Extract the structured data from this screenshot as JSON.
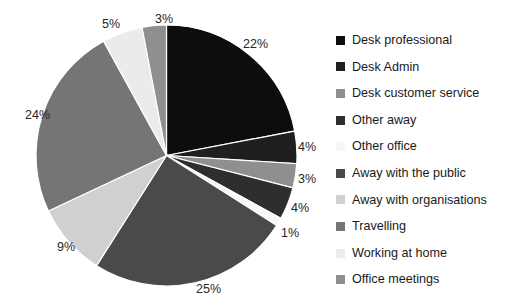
{
  "chart_data": {
    "type": "pie",
    "title": "",
    "subtitle": "",
    "xlabel": "",
    "ylabel": "",
    "legend_position": "right",
    "grid": false,
    "start_angle_deg": 0,
    "direction": "clockwise",
    "units": "%",
    "categories": [
      "Desk professional",
      "Desk Admin",
      "Desk customer service",
      "Other away",
      "Other office",
      "Away with the public",
      "Away with organisations",
      "Travelling",
      "Working at home",
      "Office meetings"
    ],
    "values": [
      22,
      4,
      3,
      4,
      1,
      25,
      9,
      24,
      5,
      3
    ],
    "data_labels": [
      "22%",
      "4%",
      "3%",
      "4%",
      "1%",
      "25%",
      "9%",
      "24%",
      "5%",
      "3%"
    ],
    "colors": [
      "#0d0d0d",
      "#1f1f1f",
      "#8f8f8f",
      "#2e2e2e",
      "#f7f7f7",
      "#4a4a4a",
      "#d0d0d0",
      "#757575",
      "#ebebeb",
      "#8f8f8f"
    ],
    "slices": [
      {
        "label": "Desk professional",
        "value": 22,
        "display": "22%",
        "color": "#0d0d0d"
      },
      {
        "label": "Desk Admin",
        "value": 4,
        "display": "4%",
        "color": "#1f1f1f"
      },
      {
        "label": "Desk customer service",
        "value": 3,
        "display": "3%",
        "color": "#8f8f8f"
      },
      {
        "label": "Other away",
        "value": 4,
        "display": "4%",
        "color": "#2e2e2e"
      },
      {
        "label": "Other office",
        "value": 1,
        "display": "1%",
        "color": "#f7f7f7"
      },
      {
        "label": "Away with the public",
        "value": 25,
        "display": "25%",
        "color": "#4a4a4a"
      },
      {
        "label": "Away with organisations",
        "value": 9,
        "display": "9%",
        "color": "#d0d0d0"
      },
      {
        "label": "Travelling",
        "value": 24,
        "display": "24%",
        "color": "#757575"
      },
      {
        "label": "Working at home",
        "value": 5,
        "display": "5%",
        "color": "#ebebeb"
      },
      {
        "label": "Office meetings",
        "value": 3,
        "display": "3%",
        "color": "#8f8f8f"
      }
    ]
  },
  "legend": {
    "items": [
      {
        "label": "Desk professional",
        "color": "#0d0d0d"
      },
      {
        "label": "Desk Admin",
        "color": "#1f1f1f"
      },
      {
        "label": "Desk customer service",
        "color": "#8f8f8f"
      },
      {
        "label": "Other away",
        "color": "#2e2e2e"
      },
      {
        "label": "Other office",
        "color": "#f7f7f7"
      },
      {
        "label": "Away with the public",
        "color": "#4a4a4a"
      },
      {
        "label": "Away with organisations",
        "color": "#d0d0d0"
      },
      {
        "label": "Travelling",
        "color": "#757575"
      },
      {
        "label": "Working at home",
        "color": "#ebebeb"
      },
      {
        "label": "Office meetings",
        "color": "#8f8f8f"
      }
    ]
  },
  "labels": {
    "positions": [
      {
        "display": "22%",
        "x": 243,
        "y": 38
      },
      {
        "display": "4%",
        "x": 298,
        "y": 141
      },
      {
        "display": "3%",
        "x": 298,
        "y": 173
      },
      {
        "display": "4%",
        "x": 291,
        "y": 202
      },
      {
        "display": "1%",
        "x": 281,
        "y": 227
      },
      {
        "display": "25%",
        "x": 196,
        "y": 283
      },
      {
        "display": "9%",
        "x": 57,
        "y": 241
      },
      {
        "display": "24%",
        "x": 25,
        "y": 109
      },
      {
        "display": "5%",
        "x": 102,
        "y": 18
      },
      {
        "display": "3%",
        "x": 155,
        "y": 13
      }
    ]
  }
}
